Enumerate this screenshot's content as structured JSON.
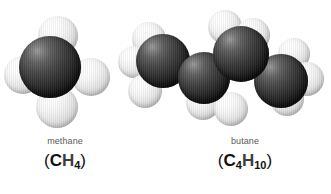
{
  "figure": {
    "background_color": "#ffffff",
    "width": 331,
    "height": 194,
    "type": "space-filling-molecular-models"
  },
  "palette": {
    "carbon_color": "#2b2b2b",
    "hydrogen_color": "#f2f2f2",
    "name_text_color": "#5a5a5a",
    "formula_text_color": "#111111",
    "background": "#ffffff"
  },
  "molecules": [
    {
      "id": "methane",
      "name": "methane",
      "formula_parts": {
        "open_paren": "(",
        "carbon_symbol": "C",
        "carbon_count": "",
        "hydrogen_symbol": "H",
        "hydrogen_count": "4",
        "close_paren": ")"
      },
      "formula_plain": "(CH4)",
      "carbon_atoms": 1,
      "hydrogen_atoms": 4,
      "geometry": "tetrahedral"
    },
    {
      "id": "butane",
      "name": "butane",
      "formula_parts": {
        "open_paren": "(",
        "carbon_symbol": "C",
        "carbon_count": "4",
        "hydrogen_symbol": "H",
        "hydrogen_count": "10",
        "close_paren": ")"
      },
      "formula_plain": "(C4H10)",
      "carbon_atoms": 4,
      "hydrogen_atoms": 10,
      "geometry": "zigzag-chain"
    }
  ],
  "methane_atoms": [
    {
      "element": "H",
      "label": "hydrogen-top",
      "x": 38,
      "y": 16,
      "d": 40,
      "z": 2
    },
    {
      "element": "H",
      "label": "hydrogen-left",
      "x": 4,
      "y": 56,
      "d": 38,
      "z": 1
    },
    {
      "element": "H",
      "label": "hydrogen-right",
      "x": 72,
      "y": 58,
      "d": 38,
      "z": 1
    },
    {
      "element": "H",
      "label": "hydrogen-bottom",
      "x": 36,
      "y": 86,
      "d": 42,
      "z": 2
    },
    {
      "element": "C",
      "label": "carbon-center",
      "x": 19,
      "y": 36,
      "d": 62,
      "z": 3
    }
  ],
  "butane_atoms": [
    {
      "element": "H",
      "label": "h-c1-upper",
      "x": 14,
      "y": 22,
      "d": 34,
      "z": 1
    },
    {
      "element": "H",
      "label": "h-c1-left",
      "x": 0,
      "y": 46,
      "d": 32,
      "z": 1
    },
    {
      "element": "H",
      "label": "h-c1-lower",
      "x": 10,
      "y": 74,
      "d": 34,
      "z": 1
    },
    {
      "element": "H",
      "label": "h-c2-lower-a",
      "x": 68,
      "y": 86,
      "d": 34,
      "z": 1
    },
    {
      "element": "H",
      "label": "h-c2-lower-b",
      "x": 96,
      "y": 92,
      "d": 34,
      "z": 1
    },
    {
      "element": "H",
      "label": "h-c3-upper-a",
      "x": 90,
      "y": 10,
      "d": 34,
      "z": 1
    },
    {
      "element": "H",
      "label": "h-c3-upper-b",
      "x": 118,
      "y": 18,
      "d": 34,
      "z": 1
    },
    {
      "element": "H",
      "label": "h-c4-upper",
      "x": 160,
      "y": 38,
      "d": 32,
      "z": 1
    },
    {
      "element": "H",
      "label": "h-c4-right",
      "x": 172,
      "y": 62,
      "d": 34,
      "z": 1
    },
    {
      "element": "H",
      "label": "h-c4-lower",
      "x": 152,
      "y": 82,
      "d": 34,
      "z": 1
    },
    {
      "element": "C",
      "label": "carbon-1",
      "x": 18,
      "y": 34,
      "d": 54,
      "z": 3
    },
    {
      "element": "C",
      "label": "carbon-2",
      "x": 60,
      "y": 52,
      "d": 52,
      "z": 4
    },
    {
      "element": "C",
      "label": "carbon-3",
      "x": 95,
      "y": 26,
      "d": 56,
      "z": 5
    },
    {
      "element": "C",
      "label": "carbon-4",
      "x": 136,
      "y": 54,
      "d": 54,
      "z": 4
    }
  ]
}
